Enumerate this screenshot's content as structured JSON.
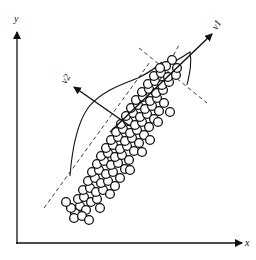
{
  "diagram": {
    "type": "pca-scatter-illustration",
    "axes": {
      "x_label": "x",
      "y_label": "y"
    },
    "vectors": [
      {
        "label": "v1",
        "description": "first principal component (major axis)"
      },
      {
        "label": "v2",
        "description": "second principal component (minor axis)"
      }
    ],
    "colors": {
      "ink": "#111111",
      "background": "#ffffff",
      "point_fill": "#ffffff"
    },
    "points": [
      [
        75,
        213
      ],
      [
        71,
        208
      ],
      [
        80,
        206
      ],
      [
        86,
        210
      ],
      [
        78,
        199
      ],
      [
        84,
        197
      ],
      [
        91,
        202
      ],
      [
        97,
        199
      ],
      [
        83,
        190
      ],
      [
        90,
        188
      ],
      [
        96,
        192
      ],
      [
        103,
        190
      ],
      [
        88,
        181
      ],
      [
        95,
        178
      ],
      [
        101,
        183
      ],
      [
        108,
        181
      ],
      [
        92,
        172
      ],
      [
        99,
        170
      ],
      [
        106,
        174
      ],
      [
        113,
        172
      ],
      [
        120,
        178
      ],
      [
        97,
        164
      ],
      [
        104,
        161
      ],
      [
        111,
        165
      ],
      [
        118,
        163
      ],
      [
        125,
        169
      ],
      [
        101,
        156
      ],
      [
        108,
        153
      ],
      [
        115,
        157
      ],
      [
        122,
        155
      ],
      [
        129,
        160
      ],
      [
        106,
        148
      ],
      [
        113,
        145
      ],
      [
        120,
        149
      ],
      [
        127,
        146
      ],
      [
        134,
        151
      ],
      [
        111,
        140
      ],
      [
        118,
        137
      ],
      [
        125,
        141
      ],
      [
        132,
        138
      ],
      [
        139,
        143
      ],
      [
        116,
        132
      ],
      [
        123,
        129
      ],
      [
        130,
        133
      ],
      [
        137,
        130
      ],
      [
        144,
        135
      ],
      [
        121,
        124
      ],
      [
        128,
        121
      ],
      [
        135,
        125
      ],
      [
        142,
        122
      ],
      [
        149,
        127
      ],
      [
        126,
        116
      ],
      [
        133,
        113
      ],
      [
        140,
        117
      ],
      [
        147,
        114
      ],
      [
        154,
        119
      ],
      [
        131,
        108
      ],
      [
        138,
        105
      ],
      [
        145,
        109
      ],
      [
        152,
        106
      ],
      [
        159,
        111
      ],
      [
        136,
        100
      ],
      [
        143,
        97
      ],
      [
        150,
        101
      ],
      [
        157,
        98
      ],
      [
        164,
        103
      ],
      [
        142,
        92
      ],
      [
        149,
        89
      ],
      [
        156,
        93
      ],
      [
        163,
        90
      ],
      [
        148,
        84
      ],
      [
        155,
        81
      ],
      [
        162,
        85
      ],
      [
        169,
        82
      ],
      [
        154,
        76
      ],
      [
        161,
        73
      ],
      [
        168,
        77
      ],
      [
        176,
        75
      ],
      [
        172,
        60
      ],
      [
        166,
        66
      ],
      [
        160,
        68
      ],
      [
        177,
        68
      ],
      [
        74,
        218
      ],
      [
        82,
        216
      ],
      [
        66,
        202
      ],
      [
        110,
        194
      ],
      [
        115,
        186
      ],
      [
        142,
        152
      ],
      [
        158,
        122
      ],
      [
        170,
        112
      ],
      [
        100,
        208
      ],
      [
        89,
        220
      ],
      [
        130,
        170
      ],
      [
        150,
        140
      ]
    ]
  }
}
